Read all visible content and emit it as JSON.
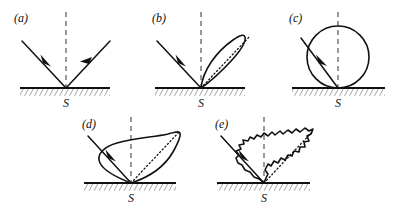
{
  "figure": {
    "width": 403,
    "height": 219,
    "background_color": "#ffffff",
    "line_color": "#111111",
    "normal_color": "#555555"
  },
  "panels": [
    {
      "id": "a",
      "label": "(a)",
      "surface_label": "S",
      "scatter_type": "specular",
      "description": "Ideal specular reflection: a single incident ray and a single reflected ray, no scattering lobe.",
      "has_lobe": false,
      "has_specular_dotted_axis": false,
      "has_reflected_ray": true,
      "incident_angle_deg": 45,
      "reflected_angle_deg": 45
    },
    {
      "id": "b",
      "label": "(b)",
      "surface_label": "S",
      "scatter_type": "narrow-lobe",
      "description": "Narrow elongated scattering lobe centered on the specular direction.",
      "has_lobe": true,
      "has_specular_dotted_axis": true,
      "has_reflected_ray": false,
      "incident_angle_deg": 45,
      "reflected_angle_deg": 45
    },
    {
      "id": "c",
      "label": "(c)",
      "surface_label": "S",
      "scatter_type": "lambertian-circle",
      "description": "Fully diffuse Lambertian scattering: a circle tangent to the surface at S.",
      "has_lobe": true,
      "has_specular_dotted_axis": false,
      "has_reflected_ray": false,
      "incident_angle_deg": 45,
      "reflected_angle_deg": 45
    },
    {
      "id": "d",
      "label": "(d)",
      "surface_label": "S",
      "scatter_type": "broad-teardrop-lobe",
      "description": "Broad smooth teardrop lobe, widened diffuse component with a tip toward the specular direction.",
      "has_lobe": true,
      "has_specular_dotted_axis": true,
      "has_reflected_ray": false,
      "incident_angle_deg": 45,
      "reflected_angle_deg": 45
    },
    {
      "id": "e",
      "label": "(e)",
      "surface_label": "S",
      "scatter_type": "speckled-lobe",
      "description": "Same broad lobe as (d) but with rapid random speckle fluctuations on its boundary.",
      "has_lobe": true,
      "has_specular_dotted_axis": true,
      "has_reflected_ray": false,
      "incident_angle_deg": 45,
      "reflected_angle_deg": 45
    }
  ]
}
